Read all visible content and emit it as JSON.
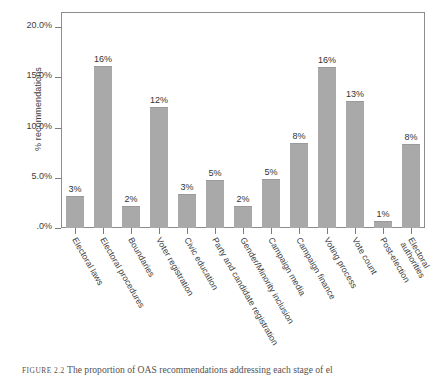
{
  "chart_data": {
    "type": "bar",
    "title": "",
    "xlabel": "",
    "ylabel": "% recommendations",
    "ylim": [
      0,
      21.5
    ],
    "grid": false,
    "legend": false,
    "ytick_labels": [
      "20.0%",
      "15.0%",
      "10.0%",
      "5.0%",
      ".0%"
    ],
    "ytick_values": [
      20,
      15,
      10,
      5,
      0
    ],
    "categories": [
      "Electoral laws",
      "Electoral procedures",
      "Boundaries",
      "Voter registration",
      "Civic education",
      "Party and candidate registration",
      "Gender/Minority inclusion",
      "Campaign media",
      "Campaign finance",
      "Voting process",
      "Vote count",
      "Post-election",
      "Electoral authorities"
    ],
    "values": [
      3.2,
      16.1,
      2.2,
      12.0,
      3.4,
      4.8,
      2.2,
      4.9,
      8.5,
      16.0,
      12.6,
      0.7,
      8.4
    ],
    "data_labels": [
      "3%",
      "16%",
      "2%",
      "12%",
      "3%",
      "5%",
      "2%",
      "5%",
      "8%",
      "16%",
      "13%",
      "1%",
      "8%"
    ],
    "bar_color": "#a9a9a9",
    "axis_color": "#8d8d8d",
    "text_color": "#3d3d3d"
  },
  "caption": {
    "figure_number": "FIGURE 2.2",
    "text": "The proportion of OAS recommendations addressing each stage of el"
  }
}
